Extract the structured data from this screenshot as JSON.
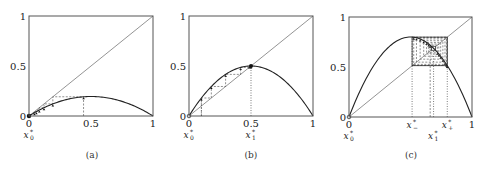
{
  "chart_data": [
    {
      "type": "line",
      "panel": "(a)",
      "caption": "(a)",
      "title": "",
      "xlabel": "",
      "ylabel": "",
      "xlim": [
        0,
        1
      ],
      "ylim": [
        0,
        1
      ],
      "xticks": [
        "0",
        "0.5",
        "1"
      ],
      "yticks": [
        "0",
        "0.5",
        "1"
      ],
      "grid": false,
      "map": "f(x) = r x (1 - x)",
      "r": 0.78,
      "series": [
        {
          "name": "identity y=x",
          "style": "thin solid"
        },
        {
          "name": "logistic map",
          "style": "solid",
          "max_value": 0.195,
          "max_at": 0.5
        }
      ],
      "cobweb": {
        "x0": 0.44,
        "iterations": 6,
        "converges_to": 0
      },
      "x_annotations": [
        {
          "label": "x",
          "sub": "0",
          "star": true,
          "x": 0,
          "row": 1
        }
      ],
      "vertical_markers": []
    },
    {
      "type": "line",
      "panel": "(b)",
      "caption": "(b)",
      "title": "",
      "xlabel": "",
      "ylabel": "",
      "xlim": [
        0,
        1
      ],
      "ylim": [
        0,
        1
      ],
      "xticks": [
        "0",
        "0.5",
        "1"
      ],
      "yticks": [
        "0",
        "0.5",
        "1"
      ],
      "grid": false,
      "map": "f(x) = r x (1 - x)",
      "r": 2.0,
      "series": [
        {
          "name": "identity y=x",
          "style": "thin solid"
        },
        {
          "name": "logistic map",
          "style": "solid",
          "max_value": 0.5,
          "max_at": 0.5
        }
      ],
      "cobweb": {
        "x0": 0.1,
        "iterations": 6,
        "converges_to": 0.5
      },
      "x_annotations": [
        {
          "label": "x",
          "sub": "0",
          "star": true,
          "x": 0,
          "row": 1
        },
        {
          "label": "x",
          "sub": "1",
          "star": true,
          "x": 0.5,
          "row": 1
        }
      ],
      "vertical_markers": [
        0.1,
        0.5
      ]
    },
    {
      "type": "line",
      "panel": "(c)",
      "caption": "(c)",
      "title": "",
      "xlabel": "",
      "ylabel": "",
      "xlim": [
        0,
        1
      ],
      "ylim": [
        0,
        1
      ],
      "xticks": [
        "0",
        "1"
      ],
      "yticks": [
        "0",
        "0.5",
        "1"
      ],
      "grid": false,
      "map": "f(x) = r x (1 - x)",
      "r": 3.2,
      "series": [
        {
          "name": "identity y=x",
          "style": "thin solid"
        },
        {
          "name": "logistic map",
          "style": "solid",
          "max_value": 0.8,
          "max_at": 0.5
        }
      ],
      "cobweb": {
        "x0": 0.66,
        "iterations": 14,
        "converges_to": "period-2 orbit {0.513, 0.799}"
      },
      "fixed_point": 0.6875,
      "period2": [
        0.513,
        0.799
      ],
      "x_annotations": [
        {
          "label": "x",
          "sub": "0",
          "star": true,
          "x": 0,
          "row": 1
        },
        {
          "label": "x",
          "sub": "−",
          "star": true,
          "x": 0.513,
          "row": 0
        },
        {
          "label": "x",
          "sub": "+",
          "star": true,
          "x": 0.799,
          "row": 0
        },
        {
          "label": "x",
          "sub": "1",
          "star": true,
          "x": 0.6875,
          "row": 1
        }
      ],
      "vertical_markers": [
        0.513,
        0.6875,
        0.799
      ]
    }
  ],
  "layout": {
    "panels": [
      {
        "x0": 29,
        "x1": 153,
        "y0": 116,
        "y1": 16,
        "cap_x": 92
      },
      {
        "x0": 189,
        "x1": 313,
        "y0": 116,
        "y1": 16,
        "cap_x": 251
      },
      {
        "x0": 349,
        "x1": 472,
        "y0": 117,
        "y1": 17,
        "cap_x": 411
      }
    ],
    "caption_y": 158,
    "colors": {
      "axis": "#555555",
      "curve": "#222222",
      "diag": "#666666",
      "cobweb": "#444444",
      "marker": "#111111"
    }
  }
}
